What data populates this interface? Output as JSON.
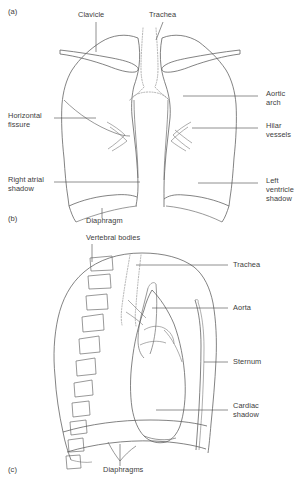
{
  "figure": {
    "background_color": "#ffffff",
    "line_color": "#5a5a5a",
    "dotted_line_color": "#9a9a9a",
    "text_color": "#3d3d3d"
  },
  "panels": [
    {
      "id": "a",
      "id_label": "(a)",
      "view": "frontal PA chest radiograph outline",
      "labels": [
        {
          "key": "clavicle",
          "text": "Clavicle",
          "lines": [
            "Clavicle"
          ],
          "side": "top"
        },
        {
          "key": "trachea",
          "text": "Trachea",
          "lines": [
            "Trachea"
          ],
          "side": "top"
        },
        {
          "key": "aortic_arch",
          "text": "Aortic arch",
          "lines": [
            "Aortic",
            "arch"
          ],
          "side": "right"
        },
        {
          "key": "hilar_vessels",
          "text": "Hilar vessels",
          "lines": [
            "Hilar",
            "vessels"
          ],
          "side": "right"
        },
        {
          "key": "left_ventricle",
          "text": "Left ventricle shadow",
          "lines": [
            "Left",
            "ventricle",
            "shadow"
          ],
          "side": "right"
        },
        {
          "key": "horizontal_fissure",
          "text": "Horizontal fissure",
          "lines": [
            "Horizontal",
            "fissure"
          ],
          "side": "left"
        },
        {
          "key": "right_atrial_shadow",
          "text": "Right atrial shadow",
          "lines": [
            "Right atrial",
            "shadow"
          ],
          "side": "left"
        },
        {
          "key": "diaphragm",
          "text": "Diaphragm",
          "lines": [
            "Diaphragm"
          ],
          "side": "bottom"
        }
      ]
    },
    {
      "id": "b",
      "id_label": "(b)",
      "view": "panel marker between frontal and lateral drawings",
      "labels": []
    },
    {
      "id": "c",
      "id_label": "(c)",
      "view": "lateral chest radiograph outline",
      "labels": [
        {
          "key": "vertebral_bodies",
          "text": "Vertebral bodies",
          "lines": [
            "Vertebral bodies"
          ],
          "side": "top"
        },
        {
          "key": "trachea_lat",
          "text": "Trachea",
          "lines": [
            "Trachea"
          ],
          "side": "right"
        },
        {
          "key": "aorta",
          "text": "Aorta",
          "lines": [
            "Aorta"
          ],
          "side": "right"
        },
        {
          "key": "sternum",
          "text": "Sternum",
          "lines": [
            "Sternum"
          ],
          "side": "right"
        },
        {
          "key": "cardiac_shadow",
          "text": "Cardiac shadow",
          "lines": [
            "Cardiac",
            "shadow"
          ],
          "side": "right"
        },
        {
          "key": "diaphragms",
          "text": "Diaphragms",
          "lines": [
            "Diaphragms"
          ],
          "side": "bottom"
        }
      ]
    }
  ],
  "text": {
    "panel_a": "(a)",
    "panel_b": "(b)",
    "panel_c": "(c)",
    "clavicle": "Clavicle",
    "trachea_top": "Trachea",
    "aortic_1": "Aortic",
    "aortic_2": "arch",
    "hilar_1": "Hilar",
    "hilar_2": "vessels",
    "horizontal_1": "Horizontal",
    "horizontal_2": "fissure",
    "right_atrial_1": "Right atrial",
    "right_atrial_2": "shadow",
    "left_vent_1": "Left",
    "left_vent_2": "ventricle",
    "left_vent_3": "shadow",
    "diaphragm": "Diaphragm",
    "vertebral_bodies": "Vertebral bodies",
    "trachea_lat": "Trachea",
    "aorta": "Aorta",
    "sternum": "Sternum",
    "cardiac_1": "Cardiac",
    "cardiac_2": "shadow",
    "diaphragms": "Diaphragms"
  }
}
